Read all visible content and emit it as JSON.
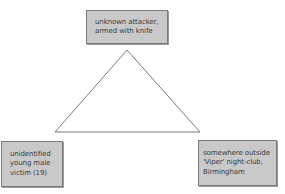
{
  "diagram": {
    "type": "triangle",
    "line_color": "#7a7a7a",
    "box_fill": "#c9c9c9",
    "box_border": "#7a7a7a",
    "text_color": "#3a3a3a",
    "nodes": {
      "top": {
        "lines": [
          "unknown attacker,",
          "armed with knife"
        ]
      },
      "left": {
        "lines": [
          "unidentified",
          "young male",
          "victim (19)"
        ]
      },
      "right": {
        "lines": [
          "somewhere outside",
          "'Viper' night-club,",
          "Birmingham"
        ]
      }
    },
    "triangle": {
      "apex": [
        127,
        50
      ],
      "base_left": [
        55,
        132
      ],
      "base_right": [
        200,
        132
      ]
    }
  }
}
